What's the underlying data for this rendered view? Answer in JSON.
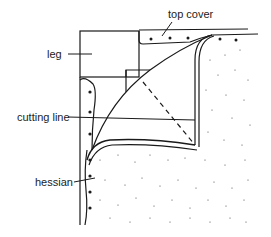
{
  "diagram": {
    "labels": {
      "top_cover": "top cover",
      "leg": "leg",
      "cutting_line": "cutting line",
      "hessian": "hessian"
    },
    "colors": {
      "line": "#1a1a1a",
      "background": "#ffffff"
    }
  }
}
